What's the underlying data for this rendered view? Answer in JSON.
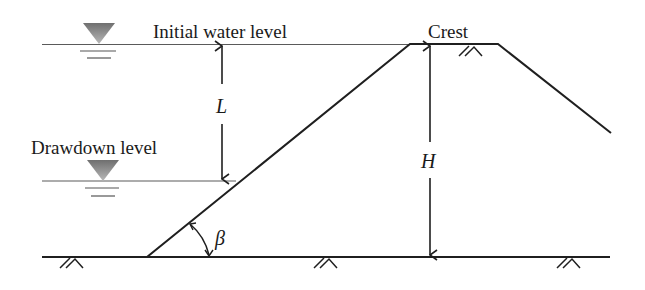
{
  "diagram": {
    "type": "embankment-drawdown-cross-section",
    "labels": {
      "initial_water_level": "Initial water level",
      "drawdown_level": "Drawdown level",
      "crest": "Crest",
      "drawdown_depth": "L",
      "embankment_height": "H",
      "slope_angle": "β"
    },
    "colors": {
      "line": "#1f1f1f",
      "water_thin_line": "#555555",
      "water_triangle_top": "#6f6f6f",
      "water_triangle_bottom": "#b5b5b5",
      "background": "#ffffff"
    }
  }
}
